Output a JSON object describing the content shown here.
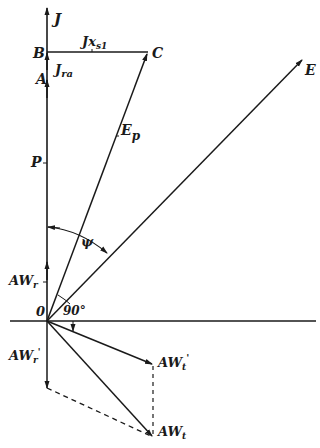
{
  "diagram": {
    "type": "phasor-diagram",
    "labels": {
      "J": "J",
      "B": "B",
      "C": "C",
      "Jxs1_main": "Jx",
      "Jxs1_sub": "s1",
      "A": "A",
      "Jra_main": "J",
      "Jra_sub": "ra",
      "E": "E",
      "Ep_main": "E",
      "Ep_sub": "p",
      "P": "P",
      "psi": "ψ",
      "AWr_main": "AW",
      "AWr_sub": "r",
      "O": "0",
      "angle90": "90°",
      "AWr2_main": "AW",
      "AWr2_sub": "r",
      "AWr2_prime": "'",
      "AWt1_main": "AW",
      "AWt1_sub": "t",
      "AWt1_prime": "'",
      "AWt_main": "AW",
      "AWt_sub": "t"
    },
    "colors": {
      "ink": "#1a1a1a",
      "background": "#ffffff"
    }
  }
}
